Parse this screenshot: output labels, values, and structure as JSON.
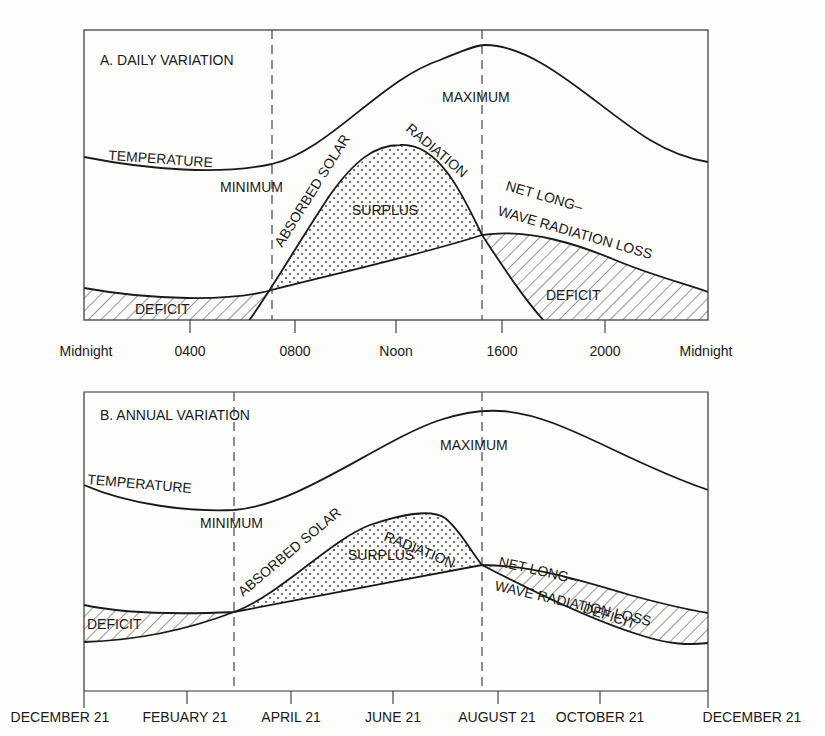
{
  "panels": [
    {
      "title": "A. DAILY VARIATION",
      "labels": {
        "temperature": "TEMPERATURE",
        "maximum": "MAXIMUM",
        "minimum": "MINIMUM",
        "absorbed_solar": "ABSORBED SOLAR RADIATION",
        "surplus": "SURPLUS",
        "net_longwave_1": "NET LONG–",
        "net_longwave_2": "WAVE RADIATION LOSS",
        "deficit_left": "DEFICIT",
        "deficit_right": "DEFICIT"
      },
      "x_ticks": [
        "Midnight",
        "0400",
        "0800",
        "Noon",
        "1600",
        "2000",
        "Midnight"
      ]
    },
    {
      "title": "B. ANNUAL VARIATION",
      "labels": {
        "temperature": "TEMPERATURE",
        "maximum": "MAXIMUM",
        "minimum": "MINIMUM",
        "absorbed_solar": "ABSORBED SOLAR RADIATION",
        "surplus": "SURPLUS",
        "net_longwave_1": "NET LONG–",
        "net_longwave_2": "WAVE RADIATION LOSS",
        "deficit_left": "DEFICIT",
        "deficit_right": "DEFICIT"
      },
      "x_ticks": [
        "DECEMBER 21",
        "FEBUARY 21",
        "APRIL 21",
        "JUNE 21",
        "AUGUST 21",
        "OCTOBER 21",
        "DECEMBER 21"
      ]
    }
  ],
  "colors": {
    "ink": "#1a1a1a",
    "paper": "#fdfdfb"
  }
}
